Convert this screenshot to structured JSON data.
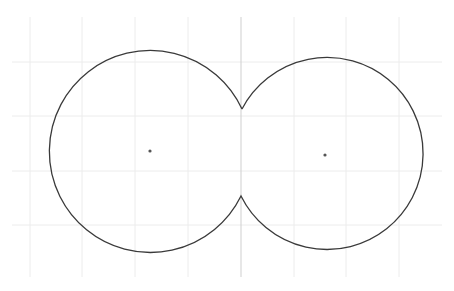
{
  "diagram": {
    "type": "geometry-construction",
    "colors": {
      "background": "#ffffff",
      "grid": "#ececec",
      "axis": "#cfcfcf",
      "outline": "#3a3a3a",
      "center_point": "#555555"
    },
    "grid": {
      "x_min": 12,
      "x_max": 442,
      "y_min": 17,
      "y_max": 277,
      "vertical_lines": [
        30,
        82,
        135,
        188,
        294,
        346,
        399
      ],
      "horizontal_lines": [
        62,
        116,
        171,
        225
      ]
    },
    "axis": {
      "x": 241,
      "y_top": 17,
      "y_bottom": 277
    },
    "circles": [
      {
        "name": "left-circle",
        "cx": 150,
        "cy": 151,
        "r": 101
      },
      {
        "name": "right-circle",
        "cx": 325,
        "cy": 155,
        "r": 96
      }
    ],
    "cusps": [
      {
        "name": "top-cusp",
        "x": 242,
        "y": 109
      },
      {
        "name": "bottom-cusp",
        "x": 241,
        "y": 196
      }
    ]
  }
}
